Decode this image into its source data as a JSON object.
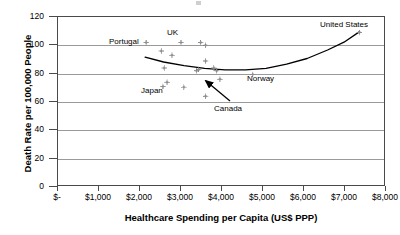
{
  "chart_data": {
    "type": "scatter",
    "title": "",
    "xlabel": "Healthcare Spending per Capita (US$ PPP)",
    "ylabel": "Death Rate per 100,000 People",
    "xlim": [
      0,
      8000
    ],
    "ylim": [
      0,
      120
    ],
    "xticks": [
      0,
      1000,
      2000,
      3000,
      4000,
      5000,
      6000,
      7000,
      8000
    ],
    "xtick_labels": [
      "$-",
      "$1,000",
      "$2,000",
      "$3,000",
      "$4,000",
      "$5,000",
      "$6,000",
      "$7,000",
      "$8,000"
    ],
    "yticks": [
      0,
      20,
      40,
      60,
      80,
      100,
      120
    ],
    "ytick_labels": [
      "0",
      "20",
      "40",
      "60",
      "80",
      "100",
      "120"
    ],
    "grid": "horizontal",
    "legend": "none",
    "marker": "diamond",
    "marker_color": "#8d8d8d",
    "trendline_color": "#000000",
    "frame_color": "#4a4a4a",
    "gridline_color": "#9a9a9a",
    "points": [
      {
        "x": 2150,
        "y": 102,
        "label": "Portugal"
      },
      {
        "x": 2520,
        "y": 96,
        "label": ""
      },
      {
        "x": 2590,
        "y": 84,
        "label": ""
      },
      {
        "x": 2560,
        "y": 71,
        "label": ""
      },
      {
        "x": 2660,
        "y": 74,
        "label": ""
      },
      {
        "x": 2780,
        "y": 93,
        "label": ""
      },
      {
        "x": 3000,
        "y": 102,
        "label": "UK"
      },
      {
        "x": 3070,
        "y": 70.5,
        "label": ""
      },
      {
        "x": 3380,
        "y": 82,
        "label": ""
      },
      {
        "x": 3430,
        "y": 83,
        "label": ""
      },
      {
        "x": 3480,
        "y": 102,
        "label": ""
      },
      {
        "x": 3600,
        "y": 100,
        "label": ""
      },
      {
        "x": 3600,
        "y": 89,
        "label": ""
      },
      {
        "x": 3600,
        "y": 64,
        "label": ""
      },
      {
        "x": 3800,
        "y": 84,
        "label": ""
      },
      {
        "x": 3870,
        "y": 82,
        "label": ""
      },
      {
        "x": 3950,
        "y": 76,
        "label": "Canada"
      },
      {
        "x": 4750,
        "y": 79.5,
        "label": "Norway"
      },
      {
        "x": 7350,
        "y": 109,
        "label": "United States"
      }
    ],
    "trendline": {
      "description": "U-shaped quadratic fit",
      "points": [
        {
          "x": 2150,
          "y": 91
        },
        {
          "x": 2600,
          "y": 87.5
        },
        {
          "x": 3100,
          "y": 85
        },
        {
          "x": 3600,
          "y": 83
        },
        {
          "x": 4100,
          "y": 82
        },
        {
          "x": 4600,
          "y": 82
        },
        {
          "x": 5100,
          "y": 83
        },
        {
          "x": 5600,
          "y": 86
        },
        {
          "x": 6100,
          "y": 90
        },
        {
          "x": 6600,
          "y": 96
        },
        {
          "x": 7000,
          "y": 101.5
        },
        {
          "x": 7380,
          "y": 109
        }
      ]
    },
    "annotations": [
      {
        "text": "Portugal",
        "name": "annotation-portugal",
        "x": 109,
        "y": 38
      },
      {
        "text": "UK",
        "name": "annotation-uk",
        "x": 167,
        "y": 29
      },
      {
        "text": "Japan",
        "name": "annotation-japan",
        "x": 141,
        "y": 87
      },
      {
        "text": "Norway",
        "name": "annotation-norway",
        "x": 247,
        "y": 75
      },
      {
        "text": "Canada",
        "name": "annotation-canada",
        "x": 214,
        "y": 105
      },
      {
        "text": "United States",
        "name": "annotation-united-states",
        "x": 320,
        "y": 21
      }
    ],
    "callout_arrow": {
      "from_x": 230,
      "from_y": 101,
      "to_x": 206,
      "to_y": 81,
      "target_label": "Canada"
    }
  }
}
